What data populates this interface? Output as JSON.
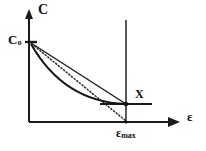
{
  "figure": {
    "caption": "",
    "background_color": "#ffffff",
    "line_color": "#1a1a1a",
    "axes": {
      "y_axis": {
        "label": "C",
        "icon": "arrow-up-icon",
        "origin_px": [
          29,
          122
        ],
        "tip_px": [
          29,
          12
        ],
        "has_arrowhead": true
      },
      "x_axis": {
        "label": "ε",
        "icon": "arrow-right-icon",
        "origin_px": [
          29,
          122
        ],
        "tip_px": [
          178,
          122
        ],
        "has_arrowhead": true
      }
    },
    "markers": [
      {
        "name": "c-zero-marker",
        "label": "C",
        "subscript": "o",
        "position_px": [
          31,
          42
        ],
        "note": "initial concentration on C axis"
      },
      {
        "name": "epsilon-max-marker",
        "label": "ε",
        "subscript": "max",
        "position_px": [
          126,
          122
        ],
        "note": "maximum strain on ε axis"
      },
      {
        "name": "x-point-marker",
        "label": "X",
        "position_px": [
          126,
          104
        ],
        "note": "common endpoint of the curves"
      }
    ],
    "curves": [
      {
        "name": "straight-chord-line",
        "style": "solid",
        "from_px": [
          31,
          42
        ],
        "to_px": [
          126,
          104
        ],
        "description": "straight solid line from Co to X"
      },
      {
        "name": "dotted-line",
        "style": "dotted",
        "from_px": [
          31,
          42
        ],
        "to_px": [
          126,
          122
        ],
        "description": "dotted line from Co down to epsilon-max on the axis"
      },
      {
        "name": "convex-curve",
        "style": "solid-curved",
        "from_px": [
          31,
          42
        ],
        "to_px": [
          126,
          104
        ],
        "control_px": [
          64,
          100
        ],
        "description": "convex (sagging) solid curve from Co to X"
      }
    ],
    "guides": [
      {
        "name": "epsilon-max-vertical-line",
        "style": "solid",
        "from_px": [
          126,
          20
        ],
        "to_px": [
          126,
          122
        ],
        "description": "vertical reference line at epsilon-max"
      },
      {
        "name": "x-horizontal-line",
        "style": "solid",
        "from_px": [
          100,
          104
        ],
        "to_px": [
          152,
          104
        ],
        "description": "short horizontal reference line through X"
      }
    ]
  }
}
